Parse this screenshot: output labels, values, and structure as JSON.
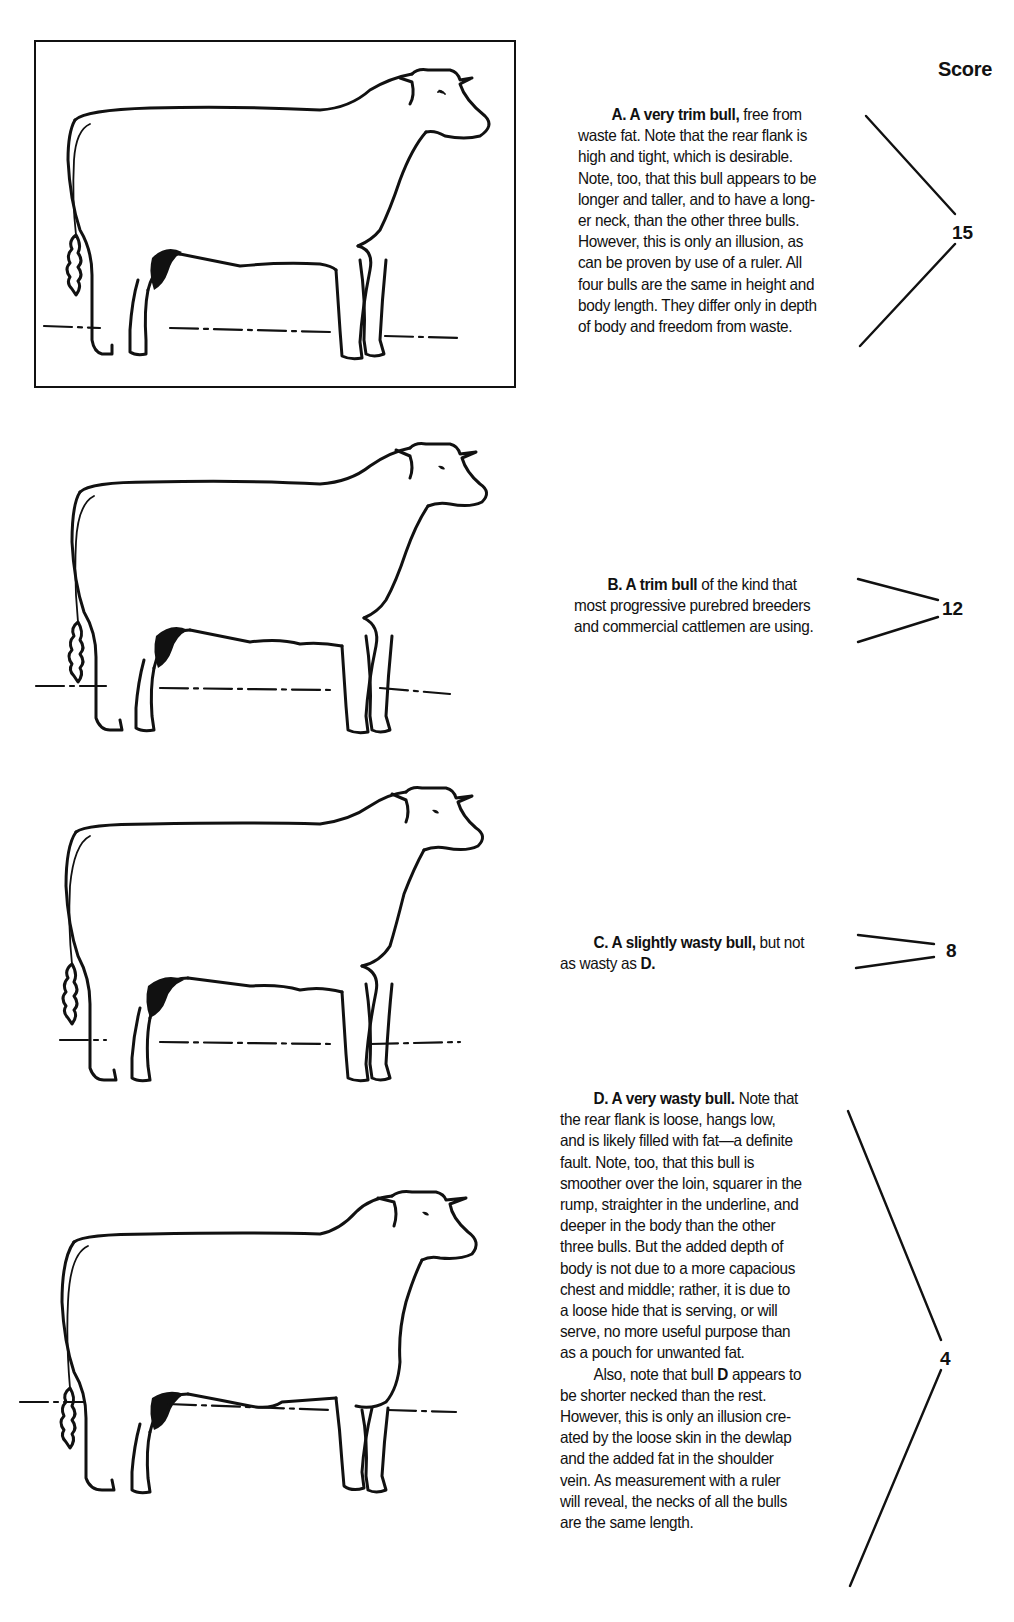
{
  "page": {
    "score_header": "Score"
  },
  "bulls": [
    {
      "id": "A",
      "score": "15",
      "framed": true,
      "description": {
        "lead_bold": "A. A very trim bull,",
        "lines": [
          "free from",
          "waste fat. Note that the rear flank is",
          "high and tight, which is desirable.",
          "Note, too, that this bull appears to be",
          "longer and taller, and to have a long-",
          "er neck, than the other three bulls.",
          "However, this is only an illusion, as",
          "can be proven by use of a ruler. All",
          "four bulls are the same in height and",
          "body length. They differ only in depth",
          "of body and freedom from waste."
        ]
      }
    },
    {
      "id": "B",
      "score": "12",
      "framed": false,
      "description": {
        "lead_bold": "B. A trim bull",
        "lines": [
          "of the kind that",
          "most progressive purebred breeders",
          "and commercial cattlemen are using."
        ]
      }
    },
    {
      "id": "C",
      "score": "8",
      "framed": false,
      "description": {
        "lead_bold": "C. A slightly wasty bull,",
        "lines": [
          "but not",
          "as wasty as"
        ],
        "trailing_bold": "D."
      }
    },
    {
      "id": "D",
      "score": "4",
      "framed": false,
      "description": {
        "lead_bold": "D. A very wasty bull.",
        "lines": [
          "Note that",
          "the rear flank is loose, hangs low,",
          "and is likely filled with fat—a definite",
          "fault. Note, too, that this bull is",
          "smoother over the loin, squarer in the",
          "rump, straighter in the underline, and",
          "deeper in the body than the other",
          "three bulls. But the added depth of",
          "body is not due to a more capacious",
          "chest and middle; rather, it is due to",
          "a loose hide that is serving, or will",
          "serve, no more useful purpose than",
          "as a pouch for unwanted fat."
        ],
        "para2_pre": "Also, note that bull",
        "para2_bold": "D",
        "para2_post": "appears to",
        "para2_lines": [
          "be shorter necked than the rest.",
          "However, this is only an illusion cre-",
          "ated by the loose skin in the dewlap",
          "and the added fat in the shoulder",
          "vein. As measurement with a ruler",
          "will reveal, the necks of all the bulls",
          "are the same length."
        ]
      }
    }
  ],
  "icons": {
    "bull_illustration": "bull-side-view-line-drawing",
    "score_bracket": "angle-bracket-lines"
  },
  "colors": {
    "ink": "#111111",
    "paper": "#ffffff"
  }
}
